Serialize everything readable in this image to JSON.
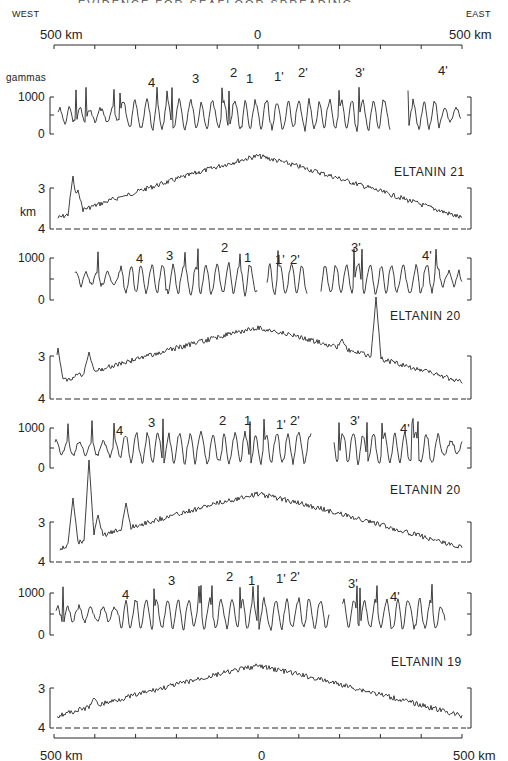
{
  "header": {
    "title_fragment": "EVIDENCE FOR SEAFLOOR SPREADING",
    "west_label": "WEST",
    "east_label": "EAST",
    "scale_left": "500 km",
    "scale_center": "0",
    "scale_right": "500 km"
  },
  "footer": {
    "scale_left": "500 km",
    "scale_center": "0",
    "scale_right": "500 km"
  },
  "axis_units": {
    "magnetic": "gammas",
    "bathymetry": "km"
  },
  "chart_data": {
    "type": "line",
    "xlabel": "Distance from ridge axis (km), WEST to EAST",
    "x_range": [
      -500,
      500
    ],
    "x_ticks": [
      -500,
      -400,
      -300,
      -200,
      -100,
      0,
      100,
      200,
      300,
      400,
      500
    ],
    "panels": [
      {
        "kind": "magnetic",
        "ylabel": "gammas",
        "y_ticks": [
          "1000",
          "0"
        ],
        "anomaly_labels": [
          "4",
          "3",
          "2",
          "1",
          "1'",
          "2'",
          "3'",
          "4'"
        ],
        "anomaly_x_km": [
          -340,
          -200,
          -110,
          -40,
          35,
          100,
          215,
          410
        ],
        "gaps_km": [
          [
            305,
            330
          ]
        ]
      },
      {
        "kind": "bathymetry",
        "ship": "ELTANIN 21",
        "ylabel": "km",
        "y_ticks": [
          "3",
          "4"
        ],
        "peak_depth_km": 2.4,
        "flank_depth_km": 3.9
      },
      {
        "kind": "magnetic",
        "ylabel": "",
        "y_ticks": [
          "1000",
          "0"
        ],
        "anomaly_labels": [
          "4",
          "3",
          "2",
          "1",
          "1'",
          "2'",
          "3'",
          "4'"
        ],
        "anomaly_x_km": [
          -290,
          -220,
          -100,
          -40,
          35,
          70,
          220,
          390
        ],
        "gaps_km": [
          [
            20,
            30
          ],
          [
            125,
            140
          ]
        ]
      },
      {
        "kind": "bathymetry",
        "ship": "ELTANIN 20",
        "ylabel": "",
        "y_ticks": [
          "3",
          "4"
        ],
        "peak_depth_km": 2.6,
        "flank_depth_km": 3.6
      },
      {
        "kind": "magnetic",
        "ylabel": "",
        "y_ticks": [
          "1000",
          "0"
        ],
        "anomaly_labels": [
          "4",
          "3",
          "2",
          "1",
          "1'",
          "2'",
          "3'",
          "4'"
        ],
        "anomaly_x_km": [
          -320,
          -255,
          -80,
          -25,
          50,
          75,
          225,
          350
        ],
        "gaps_km": [
          [
            125,
            165
          ]
        ]
      },
      {
        "kind": "bathymetry",
        "ship": "ELTANIN 20",
        "ylabel": "",
        "y_ticks": [
          "3",
          "4"
        ],
        "peak_depth_km": 2.7,
        "flank_depth_km": 3.8
      },
      {
        "kind": "magnetic",
        "ylabel": "",
        "y_ticks": [
          "1000",
          "0"
        ],
        "anomaly_labels": [
          "4",
          "3",
          "2",
          "1",
          "1'",
          "2'",
          "3'",
          "4'"
        ],
        "anomaly_x_km": [
          -330,
          -215,
          -95,
          -55,
          0,
          65,
          210,
          330
        ],
        "gaps_km": [
          [
            170,
            180
          ],
          [
            430,
            500
          ]
        ]
      },
      {
        "kind": "bathymetry",
        "ship": "ELTANIN 19",
        "ylabel": "",
        "y_ticks": [
          "3",
          "4"
        ],
        "peak_depth_km": 2.8,
        "flank_depth_km": 3.8
      }
    ]
  },
  "render": {
    "x0": 54,
    "x1": 462,
    "mag_panels": [
      {
        "top": 97,
        "mid": 115,
        "bot": 134,
        "labels": [
          {
            "t": "4",
            "x": 148,
            "y": 76
          },
          {
            "t": "3",
            "x": 192,
            "y": 72
          },
          {
            "t": "2",
            "x": 230,
            "y": 66
          },
          {
            "t": "1",
            "x": 246,
            "y": 72
          },
          {
            "t": "1'",
            "x": 274,
            "y": 70
          },
          {
            "t": "2'",
            "x": 298,
            "y": 66
          },
          {
            "t": "3'",
            "x": 355,
            "y": 66
          },
          {
            "t": "4'",
            "x": 438,
            "y": 64
          }
        ],
        "seed": 11,
        "start": 58,
        "end": 461,
        "gaps": [
          [
            391,
            407
          ]
        ]
      },
      {
        "top": 258,
        "mid": 279,
        "bot": 300,
        "labels": [
          {
            "t": "4",
            "x": 136,
            "y": 252
          },
          {
            "t": "3",
            "x": 166,
            "y": 249
          },
          {
            "t": "2",
            "x": 221,
            "y": 241
          },
          {
            "t": "1",
            "x": 244,
            "y": 251
          },
          {
            "t": "1'",
            "x": 275,
            "y": 253
          },
          {
            "t": "2'",
            "x": 290,
            "y": 253
          },
          {
            "t": "3'",
            "x": 351,
            "y": 241
          },
          {
            "t": "4'",
            "x": 422,
            "y": 249
          }
        ],
        "seed": 23,
        "start": 75,
        "end": 462,
        "gaps": [
          [
            258,
            266
          ],
          [
            308,
            320
          ]
        ]
      },
      {
        "top": 428,
        "mid": 448,
        "bot": 468,
        "labels": [
          {
            "t": "4",
            "x": 116,
            "y": 424
          },
          {
            "t": "3",
            "x": 148,
            "y": 416
          },
          {
            "t": "2",
            "x": 219,
            "y": 414
          },
          {
            "t": "1",
            "x": 244,
            "y": 414
          },
          {
            "t": "1'",
            "x": 276,
            "y": 418
          },
          {
            "t": "2'",
            "x": 290,
            "y": 414
          },
          {
            "t": "3'",
            "x": 350,
            "y": 414
          },
          {
            "t": "4'",
            "x": 400,
            "y": 422
          }
        ],
        "seed": 37,
        "start": 55,
        "end": 462,
        "gaps": [
          [
            312,
            333
          ]
        ]
      },
      {
        "top": 593,
        "mid": 614,
        "bot": 635,
        "labels": [
          {
            "t": "4",
            "x": 122,
            "y": 588
          },
          {
            "t": "3",
            "x": 168,
            "y": 574
          },
          {
            "t": "2",
            "x": 226,
            "y": 570
          },
          {
            "t": "1",
            "x": 248,
            "y": 574
          },
          {
            "t": "1'",
            "x": 276,
            "y": 572
          },
          {
            "t": "2'",
            "x": 290,
            "y": 570
          },
          {
            "t": "3'",
            "x": 348,
            "y": 577
          },
          {
            "t": "4'",
            "x": 390,
            "y": 590
          }
        ],
        "seed": 51,
        "start": 56,
        "end": 445,
        "gaps": [
          [
            330,
            341
          ]
        ]
      }
    ],
    "bath_panels": [
      {
        "top": 188,
        "bot": 229,
        "ship_x": 394,
        "ship_y": 166,
        "seed": 7,
        "start": 58,
        "end": 462,
        "peak": 156,
        "flank": 218,
        "spikes": [
          [
            73,
            176
          ],
          [
            78,
            190
          ],
          [
            124,
            196
          ]
        ]
      },
      {
        "top": 356,
        "bot": 399,
        "ship_x": 390,
        "ship_y": 310,
        "seed": 19,
        "start": 57,
        "end": 462,
        "peak": 328,
        "flank": 382,
        "spikes": [
          [
            58,
            348
          ],
          [
            89,
            352
          ],
          [
            376,
            297
          ],
          [
            342,
            339
          ]
        ]
      },
      {
        "top": 522,
        "bot": 562,
        "ship_x": 390,
        "ship_y": 484,
        "seed": 29,
        "start": 60,
        "end": 462,
        "peak": 494,
        "flank": 548,
        "spikes": [
          [
            73,
            498
          ],
          [
            89,
            460
          ],
          [
            98,
            515
          ],
          [
            126,
            503
          ]
        ]
      },
      {
        "top": 688,
        "bot": 728,
        "ship_x": 391,
        "ship_y": 656,
        "seed": 43,
        "start": 57,
        "end": 462,
        "peak": 666,
        "flank": 716,
        "spikes": [
          [
            94,
            698
          ]
        ]
      }
    ]
  }
}
